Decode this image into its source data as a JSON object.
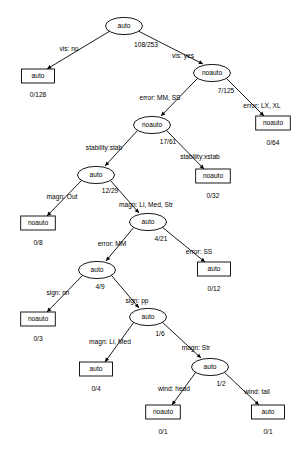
{
  "diagram": {
    "type": "decision-tree",
    "title": "",
    "nodes": [
      {
        "id": "n0",
        "label": "auto",
        "shape": "ellipse",
        "count": "108/253",
        "cx": 124,
        "cy": 26
      },
      {
        "id": "n1",
        "label": "auto",
        "shape": "box",
        "count": "0/128",
        "cx": 38,
        "cy": 76
      },
      {
        "id": "n2",
        "label": "noauto",
        "shape": "ellipse",
        "count": "7/125",
        "cx": 212,
        "cy": 73
      },
      {
        "id": "n3",
        "label": "noauto",
        "shape": "box",
        "count": "0/64",
        "cx": 273,
        "cy": 123
      },
      {
        "id": "n4",
        "label": "noauto",
        "shape": "ellipse",
        "count": "17/61",
        "cx": 152,
        "cy": 125
      },
      {
        "id": "n5",
        "label": "noauto",
        "shape": "box",
        "count": "0/32",
        "cx": 213,
        "cy": 176
      },
      {
        "id": "n6",
        "label": "auto",
        "shape": "ellipse",
        "count": "12/29",
        "cx": 96,
        "cy": 175
      },
      {
        "id": "n7",
        "label": "noauto",
        "shape": "box",
        "count": "0/8",
        "cx": 38,
        "cy": 223
      },
      {
        "id": "n8",
        "label": "auto",
        "shape": "ellipse",
        "count": "4/21",
        "cx": 148,
        "cy": 222
      },
      {
        "id": "n9",
        "label": "auto",
        "shape": "box",
        "count": "0/12",
        "cx": 214,
        "cy": 269
      },
      {
        "id": "n10",
        "label": "auto",
        "shape": "ellipse",
        "count": "4/9",
        "cx": 97,
        "cy": 270
      },
      {
        "id": "n11",
        "label": "noauto",
        "shape": "box",
        "count": "0/3",
        "cx": 38,
        "cy": 319
      },
      {
        "id": "n12",
        "label": "auto",
        "shape": "ellipse",
        "count": "1/6",
        "cx": 148,
        "cy": 317
      },
      {
        "id": "n13",
        "label": "auto",
        "shape": "box",
        "count": "0/4",
        "cx": 96,
        "cy": 369
      },
      {
        "id": "n14",
        "label": "auto",
        "shape": "ellipse",
        "count": "1/2",
        "cx": 210,
        "cy": 367
      },
      {
        "id": "n15",
        "label": "noauto",
        "shape": "box",
        "count": "0/1",
        "cx": 163,
        "cy": 412
      },
      {
        "id": "n16",
        "label": "auto",
        "shape": "box",
        "count": "0/1",
        "cx": 268,
        "cy": 412
      }
    ],
    "edges": [
      {
        "from": "n0",
        "to": "n1",
        "label": "vis: no",
        "lx": 69,
        "ly": 51
      },
      {
        "from": "n0",
        "to": "n2",
        "label": "vis: yes",
        "lx": 183,
        "ly": 58
      },
      {
        "from": "n2",
        "to": "n4",
        "label": "error: MM, SS",
        "lx": 160,
        "ly": 100
      },
      {
        "from": "n2",
        "to": "n3",
        "label": "error: LX, XL",
        "lx": 262,
        "ly": 108
      },
      {
        "from": "n4",
        "to": "n6",
        "label": "stability:stab",
        "lx": 104,
        "ly": 150
      },
      {
        "from": "n4",
        "to": "n5",
        "label": "stability:xstab",
        "lx": 200,
        "ly": 159
      },
      {
        "from": "n6",
        "to": "n7",
        "label": "magn: Out",
        "lx": 62,
        "ly": 199
      },
      {
        "from": "n6",
        "to": "n8",
        "label": "magn: Li, Med, Str",
        "lx": 146,
        "ly": 207
      },
      {
        "from": "n8",
        "to": "n10",
        "label": "error: MM",
        "lx": 112,
        "ly": 246
      },
      {
        "from": "n8",
        "to": "n9",
        "label": "error: SS",
        "lx": 199,
        "ly": 254
      },
      {
        "from": "n10",
        "to": "n11",
        "label": "sign: nn",
        "lx": 58,
        "ly": 295
      },
      {
        "from": "n10",
        "to": "n12",
        "label": "sign: pp",
        "lx": 137,
        "ly": 303
      },
      {
        "from": "n12",
        "to": "n13",
        "label": "magn: Li, Med",
        "lx": 110,
        "ly": 344
      },
      {
        "from": "n12",
        "to": "n14",
        "label": "magn: Str",
        "lx": 196,
        "ly": 350
      },
      {
        "from": "n14",
        "to": "n15",
        "label": "wind: head",
        "lx": 174,
        "ly": 391
      },
      {
        "from": "n14",
        "to": "n16",
        "label": "wind: tail",
        "lx": 257,
        "ly": 394
      }
    ],
    "count_offsets": [
      {
        "id": "n0",
        "cx": 146,
        "cy": 47
      },
      {
        "id": "n1",
        "cx": 38,
        "cy": 97
      },
      {
        "id": "n2",
        "cx": 226,
        "cy": 93
      },
      {
        "id": "n3",
        "cx": 273,
        "cy": 145
      },
      {
        "id": "n4",
        "cx": 168,
        "cy": 144
      },
      {
        "id": "n5",
        "cx": 213,
        "cy": 198
      },
      {
        "id": "n6",
        "cx": 110,
        "cy": 193
      },
      {
        "id": "n7",
        "cx": 38,
        "cy": 245
      },
      {
        "id": "n8",
        "cx": 161,
        "cy": 241
      },
      {
        "id": "n9",
        "cx": 214,
        "cy": 291
      },
      {
        "id": "n10",
        "cx": 100,
        "cy": 289
      },
      {
        "id": "n11",
        "cx": 38,
        "cy": 341
      },
      {
        "id": "n12",
        "cx": 160,
        "cy": 336
      },
      {
        "id": "n13",
        "cx": 96,
        "cy": 391
      },
      {
        "id": "n14",
        "cx": 221,
        "cy": 386
      },
      {
        "id": "n15",
        "cx": 163,
        "cy": 434
      },
      {
        "id": "n16",
        "cx": 268,
        "cy": 434
      }
    ],
    "colors": {
      "stroke": "#000000",
      "fill": "#ffffff",
      "text": "#000000",
      "background": "#ffffff"
    }
  }
}
